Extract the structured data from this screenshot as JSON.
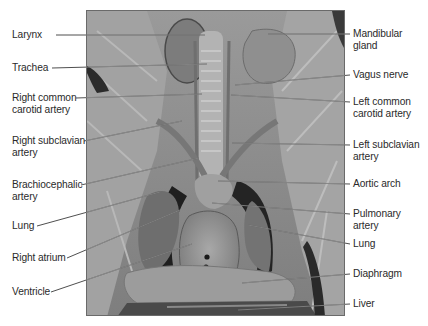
{
  "figure": {
    "left_labels": [
      {
        "id": "larynx",
        "text": "Larynx",
        "x": 12,
        "y": 29,
        "line": [
          56,
          35,
          205,
          35
        ]
      },
      {
        "id": "trachea",
        "text": "Trachea",
        "x": 12,
        "y": 62,
        "line": [
          52,
          68,
          207,
          64
        ]
      },
      {
        "id": "right-common-carotid",
        "text": "Right common\ncarotid artery",
        "x": 12,
        "y": 92,
        "line": [
          76,
          98,
          202,
          94
        ]
      },
      {
        "id": "right-subclavian",
        "text": "Right subclavian\nartery",
        "x": 12,
        "y": 135,
        "line": [
          84,
          141,
          182,
          121
        ]
      },
      {
        "id": "brachiocephalic",
        "text": "Brachiocephalic\nartery",
        "x": 12,
        "y": 179,
        "line": [
          81,
          185,
          199,
          158
        ]
      },
      {
        "id": "lung-right",
        "text": "Lung",
        "x": 12,
        "y": 220,
        "line": [
          37,
          226,
          160,
          192
        ]
      },
      {
        "id": "right-atrium",
        "text": "Right atrium",
        "x": 12,
        "y": 252,
        "line": [
          67,
          258,
          180,
          210
        ]
      },
      {
        "id": "ventricle",
        "text": "Ventricle",
        "x": 12,
        "y": 286,
        "line": [
          51,
          292,
          192,
          244
        ]
      }
    ],
    "right_labels": [
      {
        "id": "mandibular-gland",
        "text": "Mandibular\ngland",
        "x": 353,
        "y": 28,
        "line": [
          350,
          34,
          268,
          34
        ]
      },
      {
        "id": "vagus-nerve",
        "text": "Vagus nerve",
        "x": 353,
        "y": 69,
        "line": [
          350,
          75,
          235,
          85
        ]
      },
      {
        "id": "left-common-carotid",
        "text": "Left common\ncarotid artery",
        "x": 353,
        "y": 96,
        "line": [
          350,
          102,
          231,
          95
        ]
      },
      {
        "id": "left-subclavian",
        "text": "Left subclavian\nartery",
        "x": 353,
        "y": 139,
        "line": [
          350,
          145,
          232,
          143
        ]
      },
      {
        "id": "aortic-arch",
        "text": "Aortic arch",
        "x": 353,
        "y": 178,
        "line": [
          350,
          184,
          218,
          181
        ]
      },
      {
        "id": "pulmonary-artery",
        "text": "Pulmonary artery",
        "x": 353,
        "y": 208,
        "line": [
          350,
          214,
          212,
          203
        ]
      },
      {
        "id": "lung-left",
        "text": "Lung",
        "x": 353,
        "y": 238,
        "line": [
          350,
          244,
          248,
          225
        ]
      },
      {
        "id": "diaphragm",
        "text": "Diaphragm",
        "x": 353,
        "y": 268,
        "line": [
          350,
          274,
          242,
          283
        ]
      },
      {
        "id": "liver",
        "text": "Liver",
        "x": 353,
        "y": 298,
        "line": [
          350,
          304,
          238,
          310
        ]
      }
    ]
  }
}
